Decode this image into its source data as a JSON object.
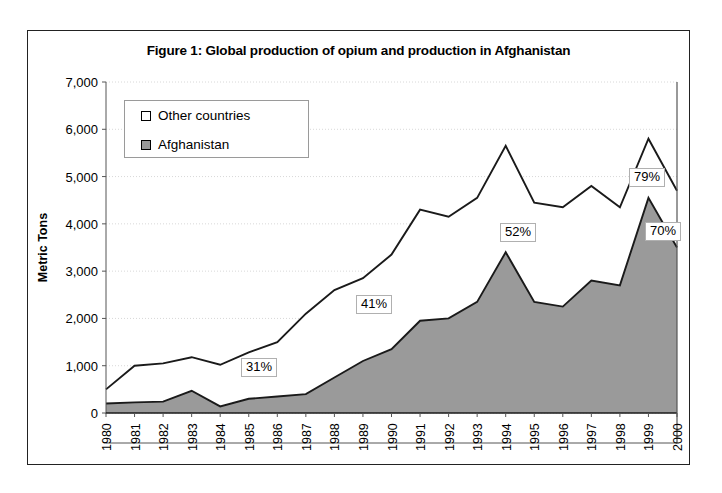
{
  "figure": {
    "title": "Figure 1: Global production of opium and production in Afghanistan"
  },
  "legend": {
    "items": [
      {
        "label": "Other countries",
        "swatch": "white",
        "color": "#ffffff"
      },
      {
        "label": "Afghanistan",
        "swatch": "gray",
        "color": "#9a9a9a"
      }
    ]
  },
  "axes": {
    "ylabel": "Metric Tons",
    "yticks": [
      "0",
      "1,000",
      "2,000",
      "3,000",
      "4,000",
      "5,000",
      "6,000",
      "7,000"
    ],
    "xticks": [
      "1980",
      "1981",
      "1982",
      "1983",
      "1984",
      "1985",
      "1986",
      "1987",
      "1988",
      "1989",
      "1990",
      "1991",
      "1992",
      "1993",
      "1994",
      "1995",
      "1996",
      "1997",
      "1998",
      "1999",
      "2000"
    ]
  },
  "annotations": [
    {
      "text": "31%",
      "year": "1986"
    },
    {
      "text": "41%",
      "year": "1990"
    },
    {
      "text": "52%",
      "year": "1994"
    },
    {
      "text": "79%",
      "year": "1999"
    },
    {
      "text": "70%",
      "year": "1999"
    }
  ],
  "chart_data": {
    "type": "area",
    "title": "Figure 1: Global production of opium and production in Afghanistan",
    "xlabel": "",
    "ylabel": "Metric Tons",
    "ylim": [
      0,
      7000
    ],
    "ytick_step": 1000,
    "grid": true,
    "legend_position": "upper-left-inside",
    "stacked": true,
    "categories": [
      "1980",
      "1981",
      "1982",
      "1983",
      "1984",
      "1985",
      "1986",
      "1987",
      "1988",
      "1989",
      "1990",
      "1991",
      "1992",
      "1993",
      "1994",
      "1995",
      "1996",
      "1997",
      "1998",
      "1999",
      "2000"
    ],
    "series": [
      {
        "name": "Afghanistan",
        "color": "#9a9a9a",
        "values": [
          200,
          225,
          240,
          470,
          140,
          300,
          350,
          400,
          750,
          1100,
          1350,
          1950,
          2000,
          2350,
          3400,
          2350,
          2250,
          2800,
          2700,
          4550,
          3500
        ]
      },
      {
        "name": "Global total",
        "color": "#ffffff",
        "values": [
          500,
          1000,
          1050,
          1180,
          1020,
          1280,
          1500,
          2100,
          2600,
          2850,
          3350,
          4300,
          4150,
          4550,
          5650,
          4450,
          4350,
          4800,
          4350,
          5800,
          4700
        ]
      }
    ],
    "notes": [
      {
        "label": "31%",
        "at_year": "1986"
      },
      {
        "label": "41%",
        "at_year": "1990"
      },
      {
        "label": "52%",
        "at_year": "1994"
      },
      {
        "label": "79%",
        "at_year": "1999"
      },
      {
        "label": "70%",
        "at_year": "1999"
      }
    ]
  }
}
